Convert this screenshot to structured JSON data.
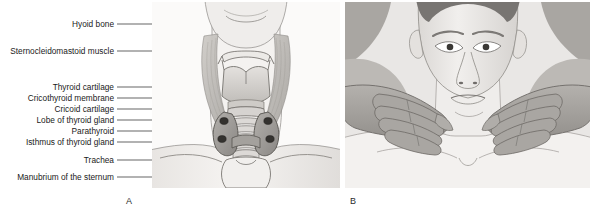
{
  "figure": {
    "panels": [
      {
        "letter": "A",
        "caption": "Anterior view of neck anatomy with labeled structures"
      },
      {
        "letter": "B",
        "caption": "Posterior approach palpation of the thyroid gland"
      }
    ]
  },
  "labels": [
    {
      "id": "hyoid-bone",
      "text": "Hyoid bone",
      "top": 19,
      "leader_y": 24,
      "leader_x1": 117,
      "leader_x2": 214
    },
    {
      "id": "sternocleidomastoid",
      "text": "Sternocleidomastoid muscle",
      "top": 46,
      "leader_y": 51,
      "leader_x1": 117,
      "leader_x2": 193
    },
    {
      "id": "thyroid-cartilage",
      "text": "Thyroid cartilage",
      "top": 82,
      "leader_y": 87,
      "leader_x1": 117,
      "leader_x2": 246
    },
    {
      "id": "cricothyroid-membrane",
      "text": "Cricothyroid membrane",
      "top": 93,
      "leader_y": 98,
      "leader_x1": 117,
      "leader_x2": 243
    },
    {
      "id": "cricoid-cartilage",
      "text": "Cricoid cartilage",
      "top": 104,
      "leader_y": 109,
      "leader_x1": 117,
      "leader_x2": 240
    },
    {
      "id": "lobe-thyroid-gland",
      "text": "Lobe of thyroid gland",
      "top": 115,
      "leader_y": 120,
      "leader_x1": 117,
      "leader_x2": 232
    },
    {
      "id": "parathyroid",
      "text": "Parathyroid",
      "top": 126,
      "leader_y": 131,
      "leader_x1": 117,
      "leader_x2": 229
    },
    {
      "id": "isthmus-thyroid-gland",
      "text": "Isthmus of thyroid gland",
      "top": 137,
      "leader_y": 142,
      "leader_x1": 117,
      "leader_x2": 225
    },
    {
      "id": "trachea",
      "text": "Trachea",
      "top": 155,
      "leader_y": 160,
      "leader_x1": 117,
      "leader_x2": 236
    },
    {
      "id": "manubrium-sternum",
      "text": "Manubrium of the sternum",
      "top": 172,
      "leader_y": 177,
      "leader_x1": 117,
      "leader_x2": 243
    }
  ],
  "colors": {
    "label_text": "#1a1a1a",
    "leader_line": "#4a4a4a",
    "panel_background": "#fdfdfd",
    "skin_light": "#f2f0ee",
    "skin_mid": "#dedbd8",
    "skin_shadow": "#c4c1bd",
    "muscle": "#b9b6b2",
    "cartilage": "#d8d5d2",
    "thyroid_gland": "#9e9b98",
    "parathyroid": "#3a3836",
    "hand_tone": "#a8a5a1",
    "hand_shadow": "#8e8b87",
    "outline": "#55524f",
    "hair": "#6e6b68"
  }
}
